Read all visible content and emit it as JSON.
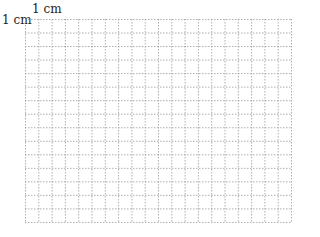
{
  "labels": {
    "top": "1 cm",
    "left": "1 cm"
  },
  "grid": {
    "columns": 20,
    "rows": 15,
    "cell_width": 13.3,
    "cell_height": 13.53,
    "line_color": "#9a9a9a",
    "line_style": "dotted"
  }
}
